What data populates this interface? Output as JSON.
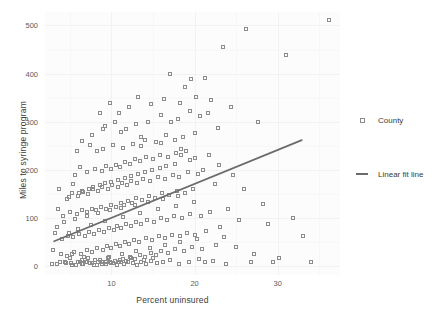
{
  "chart_data": {
    "type": "scatter",
    "title": "",
    "xlabel": "Percent uninsured",
    "ylabel": "Miles to syringe program",
    "xlim": [
      2.0,
      37.5
    ],
    "ylim": [
      -18,
      528
    ],
    "xticks": [
      10,
      20,
      30
    ],
    "yticks": [
      0,
      100,
      200,
      300,
      400,
      500
    ],
    "grid": true,
    "legend_position": "right",
    "legend": [
      {
        "name": "County",
        "marker": "open-square",
        "color": "#8b8b8b"
      },
      {
        "name": "Linear fit line",
        "marker": "line",
        "color": "#6b6b6b"
      }
    ],
    "series": [
      {
        "name": "County",
        "points": [
          [
            36.2,
            512
          ],
          [
            31.0,
            438
          ],
          [
            26.2,
            492
          ],
          [
            23.4,
            455
          ],
          [
            21.3,
            390
          ],
          [
            19.6,
            388
          ],
          [
            18.8,
            372
          ],
          [
            17.1,
            400
          ],
          [
            24.4,
            330
          ],
          [
            22.0,
            345
          ],
          [
            20.2,
            352
          ],
          [
            18.2,
            340
          ],
          [
            16.3,
            348
          ],
          [
            14.8,
            338
          ],
          [
            13.2,
            352
          ],
          [
            12.1,
            330
          ],
          [
            10.9,
            318
          ],
          [
            9.8,
            340
          ],
          [
            21.6,
            318
          ],
          [
            20.6,
            312
          ],
          [
            19.4,
            322
          ],
          [
            18.0,
            305
          ],
          [
            17.2,
            300
          ],
          [
            16.0,
            315
          ],
          [
            14.4,
            300
          ],
          [
            13.0,
            296
          ],
          [
            11.8,
            286
          ],
          [
            10.4,
            300
          ],
          [
            9.2,
            292
          ],
          [
            8.6,
            318
          ],
          [
            27.6,
            300
          ],
          [
            22.8,
            288
          ],
          [
            20.0,
            276
          ],
          [
            18.6,
            268
          ],
          [
            17.6,
            262
          ],
          [
            16.6,
            272
          ],
          [
            15.4,
            258
          ],
          [
            14.0,
            262
          ],
          [
            13.6,
            250
          ],
          [
            12.6,
            254
          ],
          [
            11.4,
            246
          ],
          [
            10.2,
            252
          ],
          [
            9.0,
            244
          ],
          [
            8.2,
            240
          ],
          [
            7.4,
            252
          ],
          [
            19.0,
            240
          ],
          [
            18.4,
            232
          ],
          [
            17.8,
            236
          ],
          [
            16.8,
            228
          ],
          [
            15.8,
            232
          ],
          [
            15.0,
            222
          ],
          [
            14.2,
            226
          ],
          [
            13.4,
            218
          ],
          [
            12.8,
            222
          ],
          [
            12.2,
            212
          ],
          [
            11.6,
            216
          ],
          [
            11.0,
            206
          ],
          [
            10.6,
            210
          ],
          [
            10.0,
            202
          ],
          [
            9.4,
            208
          ],
          [
            8.8,
            198
          ],
          [
            8.0,
            202
          ],
          [
            7.0,
            196
          ],
          [
            6.2,
            206
          ],
          [
            5.6,
            190
          ],
          [
            21.0,
            200
          ],
          [
            20.4,
            192
          ],
          [
            19.2,
            196
          ],
          [
            18.1,
            186
          ],
          [
            17.4,
            190
          ],
          [
            16.4,
            182
          ],
          [
            15.6,
            186
          ],
          [
            14.6,
            178
          ],
          [
            13.8,
            182
          ],
          [
            13.1,
            174
          ],
          [
            12.4,
            178
          ],
          [
            11.9,
            168
          ],
          [
            11.3,
            172
          ],
          [
            10.8,
            164
          ],
          [
            10.1,
            168
          ],
          [
            9.6,
            160
          ],
          [
            8.9,
            164
          ],
          [
            8.4,
            156
          ],
          [
            7.8,
            160
          ],
          [
            7.2,
            150
          ],
          [
            6.6,
            154
          ],
          [
            6.0,
            146
          ],
          [
            5.2,
            152
          ],
          [
            4.6,
            140
          ],
          [
            22.4,
            170
          ],
          [
            19.8,
            160
          ],
          [
            18.9,
            152
          ],
          [
            17.9,
            156
          ],
          [
            16.9,
            148
          ],
          [
            16.1,
            152
          ],
          [
            15.2,
            142
          ],
          [
            14.5,
            146
          ],
          [
            13.7,
            138
          ],
          [
            13.0,
            142
          ],
          [
            12.5,
            132
          ],
          [
            12.0,
            136
          ],
          [
            11.5,
            128
          ],
          [
            11.1,
            132
          ],
          [
            10.5,
            124
          ],
          [
            9.9,
            128
          ],
          [
            9.3,
            120
          ],
          [
            8.7,
            124
          ],
          [
            8.1,
            116
          ],
          [
            7.6,
            120
          ],
          [
            7.1,
            112
          ],
          [
            6.4,
            116
          ],
          [
            5.8,
            108
          ],
          [
            5.0,
            112
          ],
          [
            4.2,
            104
          ],
          [
            3.6,
            118
          ],
          [
            24.0,
            120
          ],
          [
            21.8,
            112
          ],
          [
            20.8,
            104
          ],
          [
            19.5,
            108
          ],
          [
            18.5,
            100
          ],
          [
            17.5,
            104
          ],
          [
            16.7,
            96
          ],
          [
            15.9,
            100
          ],
          [
            15.1,
            92
          ],
          [
            14.3,
            96
          ],
          [
            13.5,
            88
          ],
          [
            12.9,
            92
          ],
          [
            12.3,
            84
          ],
          [
            11.7,
            88
          ],
          [
            11.2,
            80
          ],
          [
            10.7,
            84
          ],
          [
            10.3,
            76
          ],
          [
            9.7,
            80
          ],
          [
            9.1,
            72
          ],
          [
            8.5,
            76
          ],
          [
            7.9,
            68
          ],
          [
            7.3,
            72
          ],
          [
            6.8,
            64
          ],
          [
            6.1,
            68
          ],
          [
            5.4,
            60
          ],
          [
            4.8,
            64
          ],
          [
            4.0,
            56
          ],
          [
            3.2,
            70
          ],
          [
            33.0,
            62
          ],
          [
            28.8,
            88
          ],
          [
            25.4,
            96
          ],
          [
            23.0,
            82
          ],
          [
            21.4,
            74
          ],
          [
            20.1,
            66
          ],
          [
            19.1,
            70
          ],
          [
            18.3,
            62
          ],
          [
            17.3,
            66
          ],
          [
            16.5,
            58
          ],
          [
            15.7,
            62
          ],
          [
            14.9,
            54
          ],
          [
            14.1,
            58
          ],
          [
            13.3,
            50
          ],
          [
            12.7,
            54
          ],
          [
            12.1,
            46
          ],
          [
            11.6,
            50
          ],
          [
            11.0,
            42
          ],
          [
            10.6,
            46
          ],
          [
            10.0,
            38
          ],
          [
            9.5,
            42
          ],
          [
            9.0,
            34
          ],
          [
            8.3,
            38
          ],
          [
            7.7,
            30
          ],
          [
            7.0,
            34
          ],
          [
            6.3,
            26
          ],
          [
            5.5,
            30
          ],
          [
            4.7,
            22
          ],
          [
            3.9,
            26
          ],
          [
            3.0,
            34
          ],
          [
            22.6,
            44
          ],
          [
            20.9,
            36
          ],
          [
            19.7,
            40
          ],
          [
            18.7,
            32
          ],
          [
            17.7,
            36
          ],
          [
            16.8,
            28
          ],
          [
            16.0,
            32
          ],
          [
            15.3,
            24
          ],
          [
            14.7,
            28
          ],
          [
            14.0,
            20
          ],
          [
            13.4,
            24
          ],
          [
            12.8,
            16
          ],
          [
            12.2,
            20
          ],
          [
            11.8,
            12
          ],
          [
            11.4,
            16
          ],
          [
            10.9,
            8
          ],
          [
            10.4,
            12
          ],
          [
            9.9,
            6
          ],
          [
            9.4,
            10
          ],
          [
            8.9,
            4
          ],
          [
            8.4,
            8
          ],
          [
            7.9,
            2
          ],
          [
            7.4,
            6
          ],
          [
            6.9,
            10
          ],
          [
            6.5,
            4
          ],
          [
            6.0,
            8
          ],
          [
            5.3,
            2
          ],
          [
            4.5,
            6
          ],
          [
            3.8,
            10
          ],
          [
            2.9,
            4
          ],
          [
            17.0,
            14
          ],
          [
            16.2,
            10
          ],
          [
            15.5,
            6
          ],
          [
            14.8,
            12
          ],
          [
            14.2,
            4
          ],
          [
            13.6,
            8
          ],
          [
            13.1,
            2
          ],
          [
            12.6,
            6
          ],
          [
            12.0,
            10
          ],
          [
            11.5,
            4
          ],
          [
            11.1,
            8
          ],
          [
            10.7,
            2
          ],
          [
            10.2,
            6
          ],
          [
            9.8,
            10
          ],
          [
            9.3,
            4
          ],
          [
            8.8,
            8
          ],
          [
            8.2,
            2
          ],
          [
            7.6,
            6
          ],
          [
            7.1,
            10
          ],
          [
            6.6,
            4
          ],
          [
            6.2,
            8
          ],
          [
            5.7,
            2
          ],
          [
            5.1,
            6
          ],
          [
            4.4,
            10
          ],
          [
            3.5,
            4
          ],
          [
            20.5,
            16
          ],
          [
            19.3,
            8
          ],
          [
            18.1,
            4
          ],
          [
            15.0,
            18
          ],
          [
            13.9,
            14
          ],
          [
            12.4,
            18
          ],
          [
            11.0,
            14
          ],
          [
            9.6,
            18
          ],
          [
            8.6,
            14
          ],
          [
            7.2,
            18
          ],
          [
            6.4,
            14
          ],
          [
            5.0,
            18
          ],
          [
            21.2,
            8
          ],
          [
            22.2,
            12
          ],
          [
            23.8,
            4
          ],
          [
            26.8,
            8
          ],
          [
            29.4,
            10
          ],
          [
            18.0,
            146
          ],
          [
            16.2,
            140
          ],
          [
            14.4,
            134
          ],
          [
            12.8,
            128
          ],
          [
            11.2,
            122
          ],
          [
            9.8,
            116
          ],
          [
            8.4,
            110
          ],
          [
            7.0,
            104
          ],
          [
            5.6,
            98
          ],
          [
            4.3,
            92
          ],
          [
            19.9,
            134
          ],
          [
            17.8,
            126
          ],
          [
            15.6,
            118
          ],
          [
            13.4,
            110
          ],
          [
            11.4,
            102
          ],
          [
            9.2,
            94
          ],
          [
            7.5,
            86
          ],
          [
            6.0,
            78
          ],
          [
            4.9,
            70
          ],
          [
            3.4,
            82
          ],
          [
            20.3,
            56
          ],
          [
            18.2,
            50
          ],
          [
            16.4,
            44
          ],
          [
            14.6,
            38
          ],
          [
            12.9,
            32
          ],
          [
            11.3,
            26
          ],
          [
            9.7,
            20
          ],
          [
            8.0,
            14
          ],
          [
            6.7,
            20
          ],
          [
            5.2,
            26
          ],
          [
            23.6,
            60
          ],
          [
            25.0,
            40
          ],
          [
            27.2,
            26
          ],
          [
            30.2,
            18
          ],
          [
            34.0,
            10
          ],
          [
            16.6,
            208
          ],
          [
            14.9,
            200
          ],
          [
            13.2,
            192
          ],
          [
            11.6,
            184
          ],
          [
            10.0,
            176
          ],
          [
            8.6,
            168
          ],
          [
            7.3,
            160
          ],
          [
            6.1,
            152
          ],
          [
            4.9,
            144
          ],
          [
            3.7,
            160
          ],
          [
            19.4,
            220
          ],
          [
            17.6,
            212
          ],
          [
            15.8,
            204
          ],
          [
            14.0,
            196
          ],
          [
            12.3,
            188
          ],
          [
            10.8,
            180
          ],
          [
            9.2,
            172
          ],
          [
            7.8,
            164
          ],
          [
            6.5,
            156
          ],
          [
            5.4,
            170
          ],
          [
            21.7,
            232
          ],
          [
            20.0,
            224
          ],
          [
            18.4,
            244
          ],
          [
            16.0,
            256
          ],
          [
            13.6,
            268
          ],
          [
            11.2,
            278
          ],
          [
            9.0,
            286
          ],
          [
            7.6,
            272
          ],
          [
            6.4,
            260
          ],
          [
            5.8,
            240
          ],
          [
            22.9,
            210
          ],
          [
            24.6,
            190
          ],
          [
            26.0,
            160
          ],
          [
            28.2,
            130
          ],
          [
            31.8,
            100
          ]
        ]
      }
    ],
    "fit_line": {
      "name": "Linear fit line",
      "x_start": 3.1,
      "y_start": 52,
      "x_end": 32.9,
      "y_end": 262
    }
  }
}
